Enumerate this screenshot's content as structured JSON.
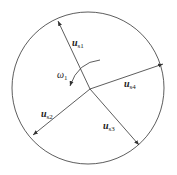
{
  "diagram": {
    "circle": {
      "cx": 88,
      "cy": 88,
      "r": 76
    },
    "origin": {
      "x": 90,
      "y": 89
    },
    "vectors": [
      {
        "name": "u",
        "sub": "s1",
        "tip": {
          "x": 58,
          "y": 21
        },
        "label_pos": {
          "x": 72,
          "y": 46
        }
      },
      {
        "name": "u",
        "sub": "s4",
        "tip": {
          "x": 163,
          "y": 64
        },
        "label_pos": {
          "x": 124,
          "y": 87
        }
      },
      {
        "name": "u",
        "sub": "s3",
        "tip": {
          "x": 139,
          "y": 145
        },
        "label_pos": {
          "x": 103,
          "y": 129
        }
      },
      {
        "name": "u",
        "sub": "s2",
        "tip": {
          "x": 33,
          "y": 135
        },
        "label_pos": {
          "x": 41,
          "y": 117
        }
      }
    ],
    "rotation": {
      "symbol": "ω",
      "sub": "1",
      "label_pos": {
        "x": 57,
        "y": 78
      }
    },
    "line_color": "#333333"
  }
}
